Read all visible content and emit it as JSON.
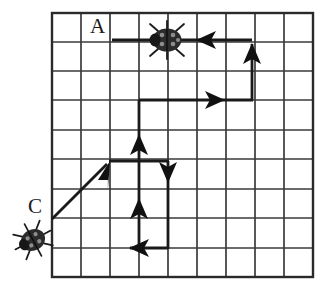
{
  "figure": {
    "type": "grid-path-diagram",
    "background_color": "#ffffff",
    "line_color": "#2a2a2a",
    "grid": {
      "columns": 9,
      "rows": 9,
      "cell_size": 29,
      "origin_x": 52,
      "origin_y": 13,
      "border_width": 2.2,
      "inner_line_width": 1.6
    },
    "labels": [
      {
        "name": "label-A",
        "text": "A",
        "x": 90,
        "y": 16
      },
      {
        "name": "label-C",
        "text": "C",
        "x": 28,
        "y": 196
      }
    ],
    "bugs": [
      {
        "name": "ladybug-on-grid",
        "cx": 167,
        "cy": 40,
        "rx": 14,
        "ry": 11,
        "rotation": 0
      },
      {
        "name": "ladybug-start",
        "cx": 33,
        "cy": 240,
        "rx": 12,
        "ry": 10,
        "rotation": -25
      }
    ],
    "path_color": "#1a1a1a",
    "path_width": 2.6,
    "segments": [
      {
        "name": "segment-diagonal-up-right",
        "x1": 52,
        "y1": 219,
        "x2": 110,
        "y2": 161,
        "arrow": "up-right",
        "arrow_at": "end"
      },
      {
        "name": "segment-right-to-vertical",
        "x1": 110,
        "y1": 161,
        "x2": 139,
        "y2": 161,
        "arrow": "none"
      },
      {
        "name": "segment-up-from-bottom",
        "x1": 139,
        "y1": 248,
        "x2": 139,
        "y2": 161,
        "arrow": "up",
        "arrow_at": "mid"
      },
      {
        "name": "segment-up-to-top-row",
        "x1": 139,
        "y1": 161,
        "x2": 139,
        "y2": 100,
        "arrow": "up",
        "arrow_at": "mid"
      },
      {
        "name": "segment-right-row4",
        "x1": 139,
        "y1": 100,
        "x2": 252,
        "y2": 100,
        "arrow": "right",
        "arrow_at": "mid"
      },
      {
        "name": "segment-up-right-column",
        "x1": 252,
        "y1": 100,
        "x2": 252,
        "y2": 40,
        "arrow": "up",
        "arrow_at": "mid"
      },
      {
        "name": "segment-left-top-row",
        "x1": 252,
        "y1": 40,
        "x2": 110,
        "y2": 40,
        "arrow": "left",
        "arrow_at": "mid"
      },
      {
        "name": "segment-down-middle",
        "x1": 168,
        "y1": 161,
        "x2": 168,
        "y2": 248,
        "arrow": "down",
        "arrow_at": "start-mid"
      },
      {
        "name": "segment-left-bottom",
        "x1": 168,
        "y1": 248,
        "x2": 126,
        "y2": 248,
        "arrow": "left",
        "arrow_at": "end"
      },
      {
        "name": "segment-join-161",
        "x1": 139,
        "y1": 161,
        "x2": 168,
        "y2": 161,
        "arrow": "none"
      }
    ],
    "arrowheads": [
      {
        "name": "arrowhead-left-top-row",
        "direction": "left",
        "x": 197,
        "y": 40
      },
      {
        "name": "arrowhead-up-right-column",
        "direction": "up",
        "x": 252,
        "y": 48
      },
      {
        "name": "arrowhead-right-row4",
        "direction": "right",
        "x": 224,
        "y": 100
      },
      {
        "name": "arrowhead-up-mid",
        "direction": "up",
        "x": 139,
        "y": 140
      },
      {
        "name": "arrowhead-up-lower",
        "direction": "up",
        "x": 139,
        "y": 204
      },
      {
        "name": "arrowhead-down-mid",
        "direction": "down",
        "x": 168,
        "y": 176
      },
      {
        "name": "arrowhead-left-bottom",
        "direction": "left",
        "x": 136,
        "y": 248
      },
      {
        "name": "arrowhead-diagonal",
        "direction": "up-right",
        "x": 108,
        "y": 163
      }
    ]
  }
}
